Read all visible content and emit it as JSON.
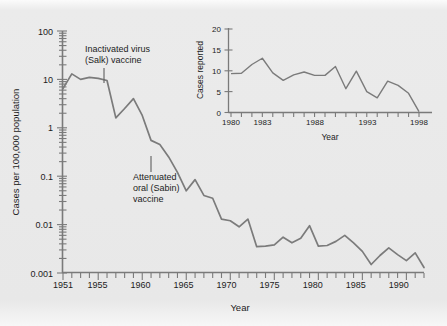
{
  "figure": {
    "background_color": "#e9e9e9",
    "line_color": "#7b7b7b",
    "axis_color": "#7a7a7a",
    "text_color": "#1c1c1c"
  },
  "main": {
    "ylabel": "Cases per 100,000 population",
    "xlabel": "Year",
    "y_ticks": [
      "100",
      "10",
      "1",
      "0.1",
      "0.01",
      "0.001"
    ],
    "x_ticks": [
      "1951",
      "1955",
      "1960",
      "1965",
      "1970",
      "1975",
      "1980",
      "1985",
      "1990"
    ],
    "annotations": [
      {
        "id": "salk",
        "lines": [
          "Inactivated virus",
          "(Salk) vaccine"
        ]
      },
      {
        "id": "sabin",
        "lines": [
          "Attenuated",
          "oral (Sabin)",
          "vaccine"
        ]
      }
    ]
  },
  "inset": {
    "ylabel": "Cases reported",
    "xlabel": "Year",
    "y_ticks": [
      "20",
      "15",
      "10",
      "5",
      "0"
    ],
    "x_ticks": [
      "1980",
      "1983",
      "1988",
      "1993",
      "1998"
    ]
  },
  "chart_data": [
    {
      "id": "main-chart",
      "type": "line",
      "title": "",
      "xlabel": "Year",
      "ylabel": "Cases per 100,000 population",
      "yscale": "log",
      "ylim": [
        0.001,
        100
      ],
      "xlim": [
        1951,
        1992
      ],
      "grid": false,
      "legend": null,
      "y_tick_values": [
        100,
        10,
        1,
        0.1,
        0.01,
        0.001
      ],
      "x_tick_values": [
        1951,
        1955,
        1960,
        1965,
        1970,
        1975,
        1980,
        1985,
        1990
      ],
      "x": [
        1951,
        1952,
        1953,
        1954,
        1955,
        1956,
        1957,
        1958,
        1959,
        1960,
        1961,
        1962,
        1963,
        1964,
        1965,
        1966,
        1967,
        1968,
        1969,
        1970,
        1971,
        1972,
        1973,
        1974,
        1975,
        1976,
        1977,
        1978,
        1979,
        1980,
        1981,
        1982,
        1983,
        1984,
        1985,
        1986,
        1987,
        1988,
        1989,
        1990,
        1991,
        1992
      ],
      "values": [
        6.5,
        13.0,
        10.0,
        11.0,
        10.5,
        9.5,
        1.6,
        2.5,
        4.0,
        1.8,
        0.55,
        0.45,
        0.25,
        0.12,
        0.05,
        0.085,
        0.04,
        0.035,
        0.013,
        0.012,
        0.009,
        0.013,
        0.0035,
        0.0036,
        0.0038,
        0.0055,
        0.0042,
        0.0052,
        0.0095,
        0.0036,
        0.0037,
        0.0045,
        0.006,
        0.0042,
        0.0028,
        0.0015,
        0.0023,
        0.0033,
        0.0024,
        0.0018,
        0.0026,
        0.0013
      ],
      "series_name": "Paralytic poliomyelitis rate",
      "annotations": [
        {
          "text": "Inactivated virus (Salk) vaccine",
          "x": 1955.5,
          "y": 10.5
        },
        {
          "text": "Attenuated oral (Sabin) vaccine",
          "x": 1961.0,
          "y": 0.5
        }
      ]
    },
    {
      "id": "inset-chart",
      "type": "line",
      "title": "",
      "xlabel": "Year",
      "ylabel": "Cases reported",
      "yscale": "linear",
      "ylim": [
        0,
        20
      ],
      "xlim": [
        1980,
        1998
      ],
      "grid": false,
      "legend": null,
      "y_tick_values": [
        0,
        5,
        10,
        15,
        20
      ],
      "x_tick_values": [
        1980,
        1983,
        1988,
        1993,
        1998
      ],
      "x": [
        1980,
        1981,
        1982,
        1983,
        1984,
        1985,
        1986,
        1987,
        1988,
        1989,
        1990,
        1991,
        1992,
        1993,
        1994,
        1995,
        1996,
        1997,
        1998
      ],
      "values": [
        9.3,
        9.4,
        11.5,
        13.0,
        9.5,
        7.7,
        9.0,
        9.7,
        8.9,
        8.9,
        11.0,
        5.7,
        9.9,
        5.0,
        3.5,
        7.5,
        6.5,
        4.6,
        0.2
      ],
      "series_name": "Cases reported"
    }
  ]
}
